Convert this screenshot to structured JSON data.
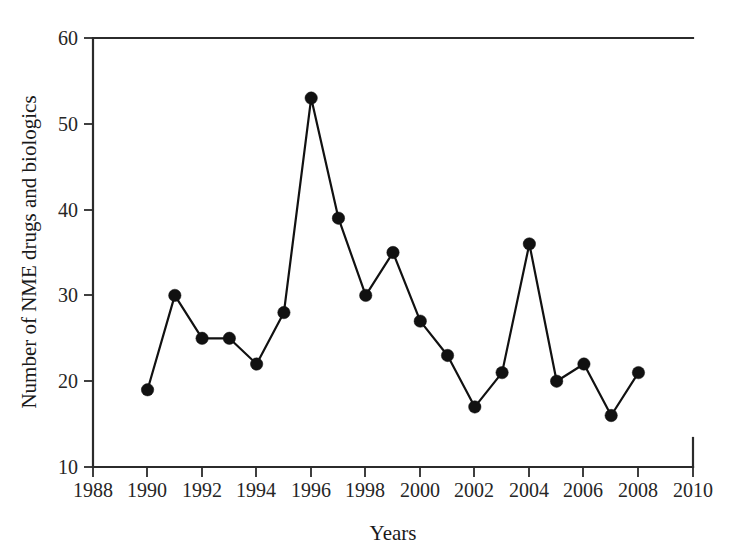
{
  "chart_data": {
    "type": "line",
    "title": "",
    "xlabel": "Years",
    "ylabel": "Number of NME drugs and biologics",
    "xlim": [
      1988,
      2010
    ],
    "ylim": [
      10,
      60
    ],
    "xticks": [
      1988,
      1990,
      1992,
      1994,
      1996,
      1998,
      2000,
      2002,
      2004,
      2006,
      2008,
      2010
    ],
    "yticks": [
      10,
      20,
      30,
      40,
      50,
      60
    ],
    "grid": false,
    "legend": "none",
    "marker": "filled-circle",
    "line_color": "#111111",
    "marker_color": "#111111",
    "x": [
      1990,
      1991,
      1992,
      1993,
      1994,
      1995,
      1996,
      1997,
      1998,
      1999,
      2000,
      2001,
      2002,
      2003,
      2004,
      2005,
      2006,
      2007,
      2008
    ],
    "values": [
      19,
      30,
      25,
      25,
      22,
      28,
      53,
      39,
      30,
      35,
      27,
      23,
      17,
      21,
      36,
      20,
      22,
      16,
      21
    ],
    "series": [
      {
        "name": "NME drugs and biologics",
        "values": [
          19,
          30,
          25,
          25,
          22,
          28,
          53,
          39,
          30,
          35,
          27,
          23,
          17,
          21,
          36,
          20,
          22,
          16,
          21
        ]
      }
    ]
  },
  "axes": {
    "x_title": "Years",
    "y_title": "Number of NME drugs and biologics",
    "x_tick_labels": [
      "1988",
      "1990",
      "1992",
      "1994",
      "1996",
      "1998",
      "2000",
      "2002",
      "2004",
      "2006",
      "2008",
      "2010"
    ],
    "y_tick_labels": [
      "10",
      "20",
      "30",
      "40",
      "50",
      "60"
    ]
  },
  "colors": {
    "line": "#111111",
    "marker": "#111111",
    "axis": "#2b2b2b",
    "text": "#1a1a1a",
    "background": "#ffffff"
  }
}
